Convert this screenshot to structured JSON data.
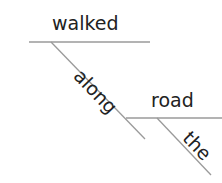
{
  "diagram": {
    "type": "sentence-diagram",
    "words": {
      "verb": "walked",
      "preposition": "along",
      "object": "road",
      "article": "the"
    },
    "colors": {
      "line": "#9a9a9a",
      "text": "#222222",
      "background": "#ffffff"
    },
    "lines": [
      {
        "name": "verb-baseline",
        "x1": 29,
        "y1": 42,
        "x2": 150,
        "y2": 42
      },
      {
        "name": "preposition-diagonal",
        "x1": 51,
        "y1": 42,
        "x2": 145,
        "y2": 139
      },
      {
        "name": "object-baseline",
        "x1": 126,
        "y1": 118,
        "x2": 222,
        "y2": 118
      },
      {
        "name": "article-diagonal",
        "x1": 157,
        "y1": 118,
        "x2": 211,
        "y2": 175
      }
    ]
  }
}
